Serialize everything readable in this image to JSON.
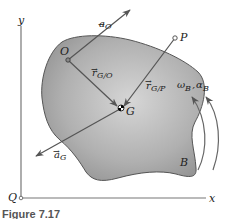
{
  "figure": {
    "caption": "Figure 7.17",
    "body_label": "B",
    "points": {
      "origin": "Q",
      "O": "O",
      "P": "P",
      "G": "G"
    },
    "axes": {
      "x": "x",
      "y": "y"
    },
    "vectors": {
      "a_O": {
        "base": "a",
        "sub": "O"
      },
      "a_G": {
        "base": "a",
        "sub": "G"
      },
      "r_GO": {
        "base": "r",
        "sub": "G/O"
      },
      "r_GP": {
        "base": "r",
        "sub": "G/P"
      }
    },
    "rotation": {
      "omega": "ω",
      "omega_sub": "B",
      "sep": ",",
      "alpha": "α",
      "alpha_sub": "B"
    },
    "colors": {
      "body_fill": "#a8a8a8",
      "body_stroke": "#555555",
      "line": "#555555",
      "text": "#222222"
    }
  }
}
